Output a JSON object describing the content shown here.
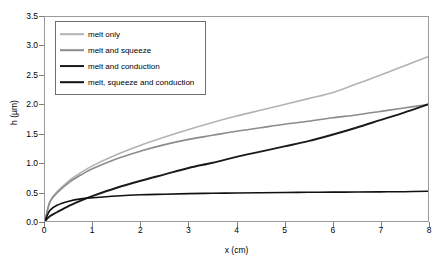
{
  "chart_data": {
    "type": "line",
    "title": "",
    "xlabel": "x (cm)",
    "ylabel": "h (µm)",
    "xlim": [
      0,
      8
    ],
    "ylim": [
      0,
      3.5
    ],
    "xticks": [
      "0",
      "1",
      "2",
      "3",
      "4",
      "5",
      "6",
      "7",
      "8"
    ],
    "yticks": [
      "0.0",
      "0.5",
      "1.0",
      "1.5",
      "2.0",
      "2.5",
      "3.0",
      "3.5"
    ],
    "grid": false,
    "legend_position": "upper-left-inside",
    "x": [
      0,
      0.1,
      0.25,
      0.5,
      0.75,
      1,
      1.5,
      2,
      2.5,
      3,
      3.5,
      4,
      4.5,
      5,
      5.5,
      6,
      6.5,
      7,
      7.5,
      8
    ],
    "series": [
      {
        "name": "melt only",
        "color": "#b3b3b3",
        "width": 1.6,
        "values": [
          0,
          0.33,
          0.5,
          0.69,
          0.83,
          0.95,
          1.14,
          1.3,
          1.44,
          1.57,
          1.69,
          1.8,
          1.9,
          2.0,
          2.1,
          2.2,
          2.35,
          2.5,
          2.66,
          2.82
        ]
      },
      {
        "name": "melt and squeeze",
        "color": "#8c8c8c",
        "width": 1.6,
        "values": [
          0,
          0.32,
          0.48,
          0.66,
          0.79,
          0.9,
          1.07,
          1.2,
          1.31,
          1.4,
          1.47,
          1.54,
          1.6,
          1.66,
          1.71,
          1.77,
          1.82,
          1.88,
          1.94,
          2.0
        ]
      },
      {
        "name": "melt and conduction",
        "color": "#1a1a1a",
        "width": 1.9,
        "values": [
          0,
          0.08,
          0.15,
          0.26,
          0.35,
          0.43,
          0.57,
          0.69,
          0.8,
          0.91,
          1.0,
          1.1,
          1.19,
          1.28,
          1.37,
          1.48,
          1.6,
          1.73,
          1.86,
          2.0
        ]
      },
      {
        "name": "melt, squeeze and conduction",
        "color": "#111111",
        "width": 1.6,
        "values": [
          0,
          0.18,
          0.27,
          0.34,
          0.38,
          0.4,
          0.43,
          0.45,
          0.46,
          0.47,
          0.475,
          0.48,
          0.485,
          0.49,
          0.492,
          0.495,
          0.497,
          0.5,
          0.503,
          0.51
        ]
      }
    ]
  },
  "legend": {
    "items": [
      {
        "label": "melt only"
      },
      {
        "label": "melt and squeeze"
      },
      {
        "label": "melt and conduction"
      },
      {
        "label": "melt, squeeze and conduction"
      }
    ]
  }
}
